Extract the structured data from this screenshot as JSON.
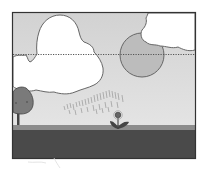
{
  "scene": {
    "description": "Grayscale illustration: landscape with clouds, sun partly behind a cloud, dotted horizon line, tree, rain shower and a small flower on the ground",
    "elements": [
      "cloud-left",
      "cloud-right",
      "sun",
      "dotted-line",
      "tree",
      "rain",
      "flower",
      "ground"
    ],
    "colors": {
      "sky": "#d6d6d6",
      "sky_lower": "#e2e2e2",
      "cloud": "#ffffff",
      "outline": "#555555",
      "sun": "#bdbdbd",
      "tree": "#777777",
      "ground_strip": "#8a8a8a",
      "ground": "#4a4a4a",
      "frame": "#333333"
    }
  }
}
